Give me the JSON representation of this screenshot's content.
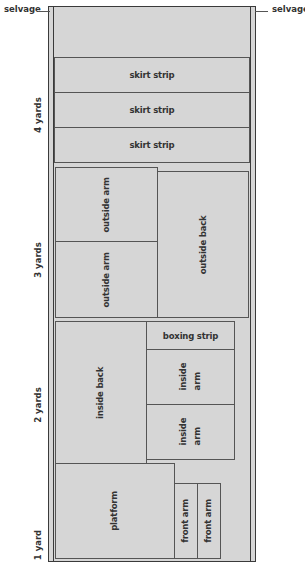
{
  "callouts": {
    "left": "selvage",
    "right": "selvage"
  },
  "yard_marks": [
    "1 yard",
    "2 yards",
    "3 yards",
    "4 yards"
  ],
  "pieces": {
    "skirt_strips": [
      "skirt strip",
      "skirt strip",
      "skirt strip"
    ],
    "outside_arms": [
      "outside arm",
      "outside arm"
    ],
    "outside_back": "outside back",
    "boxing_strip": "boxing strip",
    "inside_back": "inside back",
    "inside_arms": [
      "inside\narm",
      "inside\narm"
    ],
    "platform": "platform",
    "front_arms": [
      "front arm",
      "front arm"
    ]
  },
  "colors": {
    "fabric": "#d6d6d6",
    "outline": "#3a3a3a",
    "text": "#333333"
  }
}
